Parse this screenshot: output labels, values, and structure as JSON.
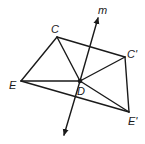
{
  "diagram": {
    "title": "",
    "colors": {
      "stroke": "#1a1a1a",
      "background": "#ffffff"
    },
    "points": {
      "C": {
        "label": "C",
        "x": 57,
        "y": 37
      },
      "C_prime": {
        "label": "C'",
        "x": 125,
        "y": 57
      },
      "E": {
        "label": "E",
        "x": 21,
        "y": 81
      },
      "E_prime": {
        "label": "E'",
        "x": 129,
        "y": 112
      },
      "D": {
        "label": "D",
        "x": 80,
        "y": 81
      }
    },
    "line": {
      "label": "m"
    },
    "segments": [
      [
        "C",
        "E"
      ],
      [
        "C",
        "C_prime"
      ],
      [
        "C",
        "D"
      ],
      [
        "E",
        "D"
      ],
      [
        "E",
        "E_prime"
      ],
      [
        "C_prime",
        "D"
      ],
      [
        "C_prime",
        "E_prime"
      ],
      [
        "D",
        "E_prime"
      ]
    ]
  }
}
